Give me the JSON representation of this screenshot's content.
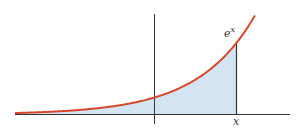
{
  "figure": {
    "function_label": "e",
    "function_exponent": "x",
    "x_marker_label": "x",
    "colors": {
      "curve": "#d9472b",
      "fill": "#d3e4f3",
      "axes": "#333333"
    }
  },
  "chart_data": {
    "type": "area",
    "title": "",
    "function": "e^x",
    "shaded_region": "area under e^x from -infinity to x",
    "annotations": [
      "e^x",
      "x"
    ],
    "x_range": [
      -2.44,
      1.77
    ],
    "marker_x": 1.44,
    "xlabel": "",
    "ylabel": ""
  }
}
